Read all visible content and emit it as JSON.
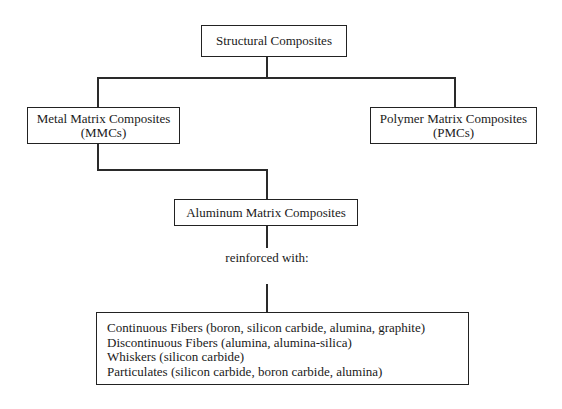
{
  "diagram": {
    "root": {
      "label": "Structural Composites"
    },
    "branches": [
      {
        "label_line1": "Metal Matrix Composites",
        "label_line2": "(MMCs)"
      },
      {
        "label_line1": "Polymer Matrix Composites",
        "label_line2": "(PMCs)"
      }
    ],
    "child": {
      "label": "Aluminum Matrix Composites"
    },
    "connector_label": "reinforced with:",
    "reinforcements": [
      "Continuous Fibers (boron, silicon carbide, alumina, graphite)",
      "Discontinuous Fibers (alumina, alumina-silica)",
      "Whiskers (silicon carbide)",
      "Particulates (silicon carbide, boron carbide, alumina)"
    ]
  }
}
